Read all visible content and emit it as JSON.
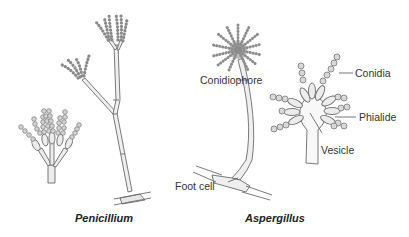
{
  "figure": {
    "panels": [
      {
        "caption": "Penicillium"
      },
      {
        "caption": "Aspergillus"
      }
    ],
    "labels": {
      "conidiophore": "Conidiophore",
      "foot_cell": "Foot cell",
      "conidia": "Conidia",
      "phialide": "Phialide",
      "vesicle": "Vesicle"
    },
    "colors": {
      "outline": "#6b6b6b",
      "fill": "#e9e9e9",
      "spore_fill": "#d4d4d4",
      "text": "#333333"
    }
  }
}
